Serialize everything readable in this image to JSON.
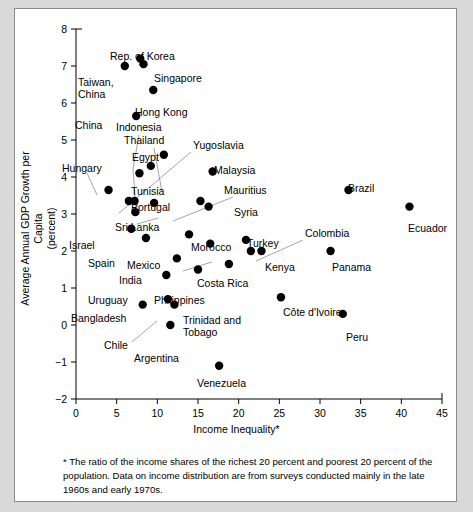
{
  "chart_data": {
    "type": "scatter",
    "title": "",
    "xlabel": "Income Inequality*",
    "ylabel": "Average Annual GDP Growth per Capita (percent)",
    "ylabel_line1": "Average Annual GDP Growth per Capita",
    "ylabel_line2": "(percent)",
    "xlim": [
      0,
      45
    ],
    "ylim": [
      -2,
      8
    ],
    "xticks": [
      0,
      5,
      10,
      15,
      20,
      25,
      30,
      35,
      40,
      45
    ],
    "yticks": [
      -2,
      -1,
      0,
      1,
      2,
      3,
      4,
      5,
      6,
      7,
      8
    ],
    "xtick_labels": [
      "0",
      "5",
      "10",
      "15",
      "20",
      "25",
      "30",
      "35",
      "40",
      "45"
    ],
    "ytick_labels": [
      "−2",
      "−1",
      "0",
      "1",
      "2",
      "3",
      "4",
      "5",
      "6",
      "7",
      "8"
    ],
    "grid": false,
    "legend": "none",
    "marker_color": "#000000",
    "points": [
      {
        "label": "Rep. of Korea",
        "x": 7.9,
        "y": 7.2
      },
      {
        "label": "Singapore",
        "x": 8.3,
        "y": 7.05
      },
      {
        "label": "Taiwan, China",
        "x": 6.0,
        "y": 7.0
      },
      {
        "label": "Hong Kong",
        "x": 9.5,
        "y": 6.35
      },
      {
        "label": "China",
        "x": 7.4,
        "y": 5.65
      },
      {
        "label": "Indonesia",
        "x": 7.8,
        "y": 4.1
      },
      {
        "label": "Thailand",
        "x": 9.2,
        "y": 4.3
      },
      {
        "label": "Egypt",
        "x": 10.8,
        "y": 4.6
      },
      {
        "label": "Yugoslavia",
        "x": 6.5,
        "y": 3.35
      },
      {
        "label": "Hungary",
        "x": 4.0,
        "y": 3.65
      },
      {
        "label": "Malaysia",
        "x": 16.8,
        "y": 4.15
      },
      {
        "label": "Tunisia",
        "x": 7.2,
        "y": 3.35
      },
      {
        "label": "Mauritius",
        "x": 15.3,
        "y": 3.35
      },
      {
        "label": "Portugal",
        "x": 9.6,
        "y": 3.3
      },
      {
        "label": "Syria",
        "x": 16.3,
        "y": 3.2
      },
      {
        "label": "Sri Lanka",
        "x": 7.3,
        "y": 3.05
      },
      {
        "label": "Brazil",
        "x": 33.5,
        "y": 3.65
      },
      {
        "label": "Ecuador",
        "x": 41.0,
        "y": 3.2
      },
      {
        "label": "Israel",
        "x": 6.8,
        "y": 2.6
      },
      {
        "label": "Spain",
        "x": 8.6,
        "y": 2.35
      },
      {
        "label": "Morocco",
        "x": 13.9,
        "y": 2.45
      },
      {
        "label": "Mexico",
        "x": 16.5,
        "y": 2.2
      },
      {
        "label": "Turkey",
        "x": 20.9,
        "y": 2.3
      },
      {
        "label": "Colombia",
        "x": 21.5,
        "y": 2.0
      },
      {
        "label": "Kenya",
        "x": 22.8,
        "y": 2.0
      },
      {
        "label": "Panama",
        "x": 31.3,
        "y": 2.0
      },
      {
        "label": "India",
        "x": 12.4,
        "y": 1.8
      },
      {
        "label": "Costa Rica",
        "x": 18.8,
        "y": 1.65
      },
      {
        "label": "Philippines",
        "x": 15.0,
        "y": 1.5
      },
      {
        "label": "Uruguay",
        "x": 11.1,
        "y": 1.35
      },
      {
        "label": "Bangladesh",
        "x": 8.2,
        "y": 0.55
      },
      {
        "label": "Chile",
        "x": 11.3,
        "y": 0.7
      },
      {
        "label": "Trinidad and Tobago",
        "x": 12.1,
        "y": 0.55
      },
      {
        "label": "Côte d'Ivoire",
        "x": 25.2,
        "y": 0.75
      },
      {
        "label": "Argentina",
        "x": 11.6,
        "y": 0.0
      },
      {
        "label": "Peru",
        "x": 32.8,
        "y": 0.3
      },
      {
        "label": "Venezuela",
        "x": 17.6,
        "y": -1.1
      }
    ]
  },
  "labels": [
    {
      "name": "rep-of-korea",
      "text": "Rep. of Korea"
    },
    {
      "name": "singapore",
      "text": "Singapore"
    },
    {
      "name": "taiwan-china-1",
      "text": "Taiwan,"
    },
    {
      "name": "taiwan-china-2",
      "text": "China"
    },
    {
      "name": "hong-kong",
      "text": "Hong Kong"
    },
    {
      "name": "china",
      "text": "China"
    },
    {
      "name": "indonesia",
      "text": "Indonesia"
    },
    {
      "name": "thailand",
      "text": "Thailand"
    },
    {
      "name": "yugoslavia",
      "text": "Yugoslavia"
    },
    {
      "name": "egypt",
      "text": "Egypt"
    },
    {
      "name": "hungary",
      "text": "Hungary"
    },
    {
      "name": "malaysia",
      "text": "Malaysia"
    },
    {
      "name": "tunisia",
      "text": "Tunisia"
    },
    {
      "name": "mauritius",
      "text": "Mauritius"
    },
    {
      "name": "portugal",
      "text": "Portugal"
    },
    {
      "name": "syria",
      "text": "Syria"
    },
    {
      "name": "sri-lanka",
      "text": "Sri Lanka"
    },
    {
      "name": "brazil",
      "text": "Brazil"
    },
    {
      "name": "ecuador",
      "text": "Ecuador"
    },
    {
      "name": "israel",
      "text": "Israel"
    },
    {
      "name": "spain",
      "text": "Spain"
    },
    {
      "name": "morocco",
      "text": "Morocco"
    },
    {
      "name": "mexico",
      "text": "Mexico"
    },
    {
      "name": "turkey",
      "text": "Turkey"
    },
    {
      "name": "colombia",
      "text": "Colombia"
    },
    {
      "name": "kenya",
      "text": "Kenya"
    },
    {
      "name": "panama",
      "text": "Panama"
    },
    {
      "name": "india",
      "text": "India"
    },
    {
      "name": "costa-rica",
      "text": "Costa Rica"
    },
    {
      "name": "philippines",
      "text": "Philippines"
    },
    {
      "name": "uruguay",
      "text": "Uruguay"
    },
    {
      "name": "bangladesh",
      "text": "Bangladesh"
    },
    {
      "name": "chile",
      "text": "Chile"
    },
    {
      "name": "trinidad-1",
      "text": "Trinidad and"
    },
    {
      "name": "trinidad-2",
      "text": "Tobago"
    },
    {
      "name": "cote-divoire",
      "text": "Côte d'Ivoire"
    },
    {
      "name": "argentina",
      "text": "Argentina"
    },
    {
      "name": "peru",
      "text": "Peru"
    },
    {
      "name": "venezuela",
      "text": "Venezuela"
    }
  ],
  "footnote": {
    "text": "* The ratio of the income shares of the richest 20 percent and poorest 20 percent of the population. Data on income distribution are from surveys conducted mainly in the late 1960s and early 1970s."
  }
}
